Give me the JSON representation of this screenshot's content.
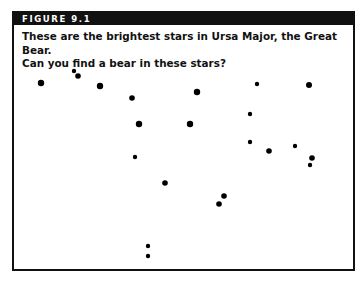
{
  "figure": {
    "label": "FIGURE 9.1",
    "caption_line1": "These are the brightest stars in Ursa Major, the Great Bear.",
    "caption_line2": "Can you find a bear in these stars?"
  },
  "stars": [
    {
      "x": 41,
      "y": 83,
      "r": 3.2
    },
    {
      "x": 74,
      "y": 71,
      "r": 2.2
    },
    {
      "x": 78,
      "y": 76,
      "r": 2.8
    },
    {
      "x": 100,
      "y": 86,
      "r": 3.2
    },
    {
      "x": 132,
      "y": 98,
      "r": 2.8
    },
    {
      "x": 139,
      "y": 124,
      "r": 3.2
    },
    {
      "x": 135,
      "y": 157,
      "r": 2.2
    },
    {
      "x": 165,
      "y": 183,
      "r": 2.8
    },
    {
      "x": 148,
      "y": 246,
      "r": 2.2
    },
    {
      "x": 148,
      "y": 256,
      "r": 2.2
    },
    {
      "x": 197,
      "y": 92,
      "r": 3.2
    },
    {
      "x": 190,
      "y": 124,
      "r": 3.2
    },
    {
      "x": 257,
      "y": 84,
      "r": 2.2
    },
    {
      "x": 309,
      "y": 85,
      "r": 3.0
    },
    {
      "x": 250,
      "y": 114,
      "r": 2.2
    },
    {
      "x": 250,
      "y": 142,
      "r": 2.2
    },
    {
      "x": 269,
      "y": 151,
      "r": 2.8
    },
    {
      "x": 295,
      "y": 146,
      "r": 2.2
    },
    {
      "x": 312,
      "y": 158,
      "r": 2.8
    },
    {
      "x": 310,
      "y": 165,
      "r": 2.2
    },
    {
      "x": 224,
      "y": 196,
      "r": 2.8
    },
    {
      "x": 219,
      "y": 204,
      "r": 2.8
    }
  ],
  "colors": {
    "frame": "#111111",
    "header_bg": "#111111",
    "header_text": "#ffffff",
    "star": "#000000"
  }
}
